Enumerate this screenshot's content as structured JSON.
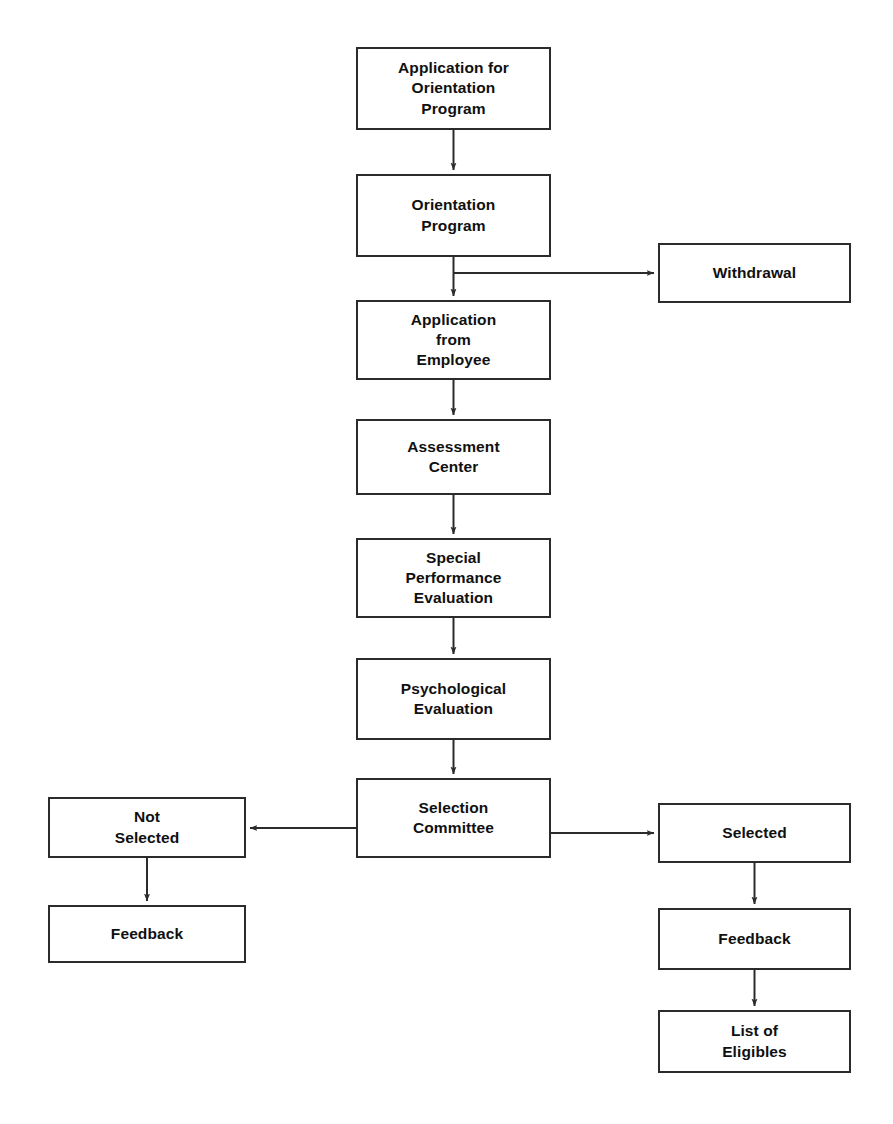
{
  "diagram": {
    "type": "flowchart",
    "orientation": "top-to-bottom",
    "canvas": {
      "width": 893,
      "height": 1124
    },
    "style": {
      "background_color": "#ffffff",
      "node_fill": "#ffffff",
      "node_border_color": "#2b2b2b",
      "node_border_width": 2,
      "text_color": "#101010",
      "edge_color": "#2b2b2b",
      "edge_width": 2
    },
    "nodes": [
      {
        "id": "application-for-orientation-program",
        "label": "Application for\nOrientation\nProgram",
        "column": "center",
        "x": 356,
        "y": 47,
        "w": 195,
        "h": 83
      },
      {
        "id": "orientation-program",
        "label": "Orientation\nProgram",
        "column": "center",
        "x": 356,
        "y": 174,
        "w": 195,
        "h": 83
      },
      {
        "id": "withdrawal",
        "label": "Withdrawal",
        "column": "right",
        "x": 658,
        "y": 243,
        "w": 193,
        "h": 60
      },
      {
        "id": "application-from-employee",
        "label": "Application\nfrom\nEmployee",
        "column": "center",
        "x": 356,
        "y": 300,
        "w": 195,
        "h": 80
      },
      {
        "id": "assessment-center",
        "label": "Assessment\nCenter",
        "column": "center",
        "x": 356,
        "y": 419,
        "w": 195,
        "h": 76
      },
      {
        "id": "special-performance-evaluation",
        "label": "Special\nPerformance\nEvaluation",
        "column": "center",
        "x": 356,
        "y": 538,
        "w": 195,
        "h": 80
      },
      {
        "id": "psychological-evaluation",
        "label": "Psychological\nEvaluation",
        "column": "center",
        "x": 356,
        "y": 658,
        "w": 195,
        "h": 82
      },
      {
        "id": "selection-committee",
        "label": "Selection\nCommittee",
        "column": "center",
        "x": 356,
        "y": 778,
        "w": 195,
        "h": 80
      },
      {
        "id": "not-selected",
        "label": "Not\nSelected",
        "column": "left",
        "x": 48,
        "y": 797,
        "w": 198,
        "h": 61
      },
      {
        "id": "selected",
        "label": "Selected",
        "column": "right",
        "x": 658,
        "y": 803,
        "w": 193,
        "h": 60
      },
      {
        "id": "feedback-not-selected",
        "label": "Feedback",
        "column": "left",
        "x": 48,
        "y": 905,
        "w": 198,
        "h": 58
      },
      {
        "id": "feedback-selected",
        "label": "Feedback",
        "column": "right",
        "x": 658,
        "y": 908,
        "w": 193,
        "h": 62
      },
      {
        "id": "list-of-eligibles",
        "label": "List of\nEligibles",
        "column": "right",
        "x": 658,
        "y": 1010,
        "w": 193,
        "h": 63
      }
    ],
    "edges": [
      {
        "id": "edge-appfororientation-to-orientationprogram",
        "from": "application-for-orientation-program",
        "to": "orientation-program",
        "kind": "straight-down",
        "label": ""
      },
      {
        "id": "edge-orientationprogram-to-withdrawal",
        "from": "orientation-program",
        "to": "withdrawal",
        "kind": "elbow-right",
        "label": ""
      },
      {
        "id": "edge-orientationprogram-to-applicationfromemployee",
        "from": "orientation-program",
        "to": "application-from-employee",
        "kind": "straight-down",
        "label": ""
      },
      {
        "id": "edge-applicationfromemployee-to-assessmentcenter",
        "from": "application-from-employee",
        "to": "assessment-center",
        "kind": "straight-down",
        "label": ""
      },
      {
        "id": "edge-assessmentcenter-to-specialperformanceevaluation",
        "from": "assessment-center",
        "to": "special-performance-evaluation",
        "kind": "straight-down",
        "label": ""
      },
      {
        "id": "edge-specialperformanceevaluation-to-psychologicalevaluation",
        "from": "special-performance-evaluation",
        "to": "psychological-evaluation",
        "kind": "straight-down",
        "label": ""
      },
      {
        "id": "edge-psychologicalevaluation-to-selectioncommittee",
        "from": "psychological-evaluation",
        "to": "selection-committee",
        "kind": "straight-down",
        "label": ""
      },
      {
        "id": "edge-selectioncommittee-to-notselected",
        "from": "selection-committee",
        "to": "not-selected",
        "kind": "straight-left",
        "label": ""
      },
      {
        "id": "edge-selectioncommittee-to-selected",
        "from": "selection-committee",
        "to": "selected",
        "kind": "straight-right",
        "label": ""
      },
      {
        "id": "edge-notselected-to-feedback",
        "from": "not-selected",
        "to": "feedback-not-selected",
        "kind": "straight-down",
        "label": ""
      },
      {
        "id": "edge-selected-to-feedback",
        "from": "selected",
        "to": "feedback-selected",
        "kind": "straight-down",
        "label": ""
      },
      {
        "id": "edge-feedback-to-listofeligibles",
        "from": "feedback-selected",
        "to": "list-of-eligibles",
        "kind": "straight-down",
        "label": ""
      }
    ]
  }
}
